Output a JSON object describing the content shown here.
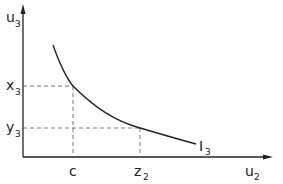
{
  "diagram": {
    "type": "indifference-curve",
    "axes": {
      "y_label": "u",
      "y_label_sub": "3",
      "x_label": "u",
      "x_label_sub": "2"
    },
    "y_ticks": [
      {
        "label": "x",
        "sub": "3"
      },
      {
        "label": "y",
        "sub": "3"
      }
    ],
    "x_ticks": [
      {
        "label": "c",
        "sub": ""
      },
      {
        "label": "z",
        "sub": "2"
      }
    ],
    "curve": {
      "label": "I",
      "label_sub": "3"
    },
    "colors": {
      "line": "#222222",
      "dashed": "#555555",
      "background": "#ffffff"
    }
  }
}
